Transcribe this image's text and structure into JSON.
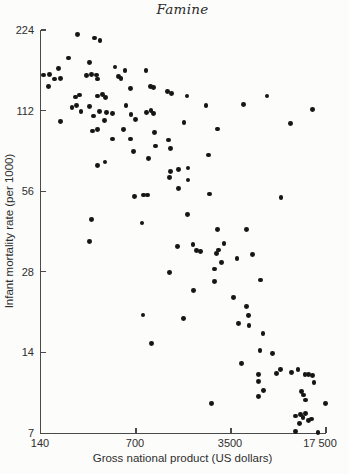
{
  "chart_data": {
    "type": "scatter",
    "title": "Famine",
    "xlabel": "Gross national product (US dollars)",
    "ylabel": "Infant mortality rate (per 1000)",
    "x_scale": "log",
    "y_scale": "log",
    "x_range": [
      140,
      17500
    ],
    "y_range": [
      7,
      224
    ],
    "grid": false,
    "x_ticks": [
      {
        "value": 140,
        "label": "140"
      },
      {
        "value": 700,
        "label": "700"
      },
      {
        "value": 3500,
        "label": "3500"
      },
      {
        "value": 17500,
        "label": "17 500"
      }
    ],
    "y_ticks": [
      {
        "value": 224,
        "label": "224"
      },
      {
        "value": 112,
        "label": "112"
      },
      {
        "value": 56,
        "label": "56"
      },
      {
        "value": 28,
        "label": "28"
      },
      {
        "value": 14,
        "label": "14"
      },
      {
        "value": 7,
        "label": "7"
      }
    ],
    "points": [
      [
        261,
        216
      ],
      [
        345,
        209
      ],
      [
        380,
        204
      ],
      [
        222,
        176
      ],
      [
        317,
        169
      ],
      [
        490,
        163
      ],
      [
        581,
        158
      ],
      [
        828,
        158
      ],
      [
        188,
        161
      ],
      [
        147,
        152
      ],
      [
        161,
        153
      ],
      [
        177,
        147
      ],
      [
        196,
        148
      ],
      [
        159,
        138
      ],
      [
        304,
        151
      ],
      [
        328,
        153
      ],
      [
        360,
        152
      ],
      [
        367,
        147
      ],
      [
        520,
        150
      ],
      [
        542,
        148
      ],
      [
        636,
        135
      ],
      [
        896,
        138
      ],
      [
        940,
        137
      ],
      [
        1200,
        132
      ],
      [
        1270,
        130
      ],
      [
        1660,
        127
      ],
      [
        250,
        126
      ],
      [
        270,
        128
      ],
      [
        367,
        127
      ],
      [
        398,
        129
      ],
      [
        416,
        125
      ],
      [
        196,
        102
      ],
      [
        237,
        115
      ],
      [
        256,
        117
      ],
      [
        276,
        111
      ],
      [
        317,
        116
      ],
      [
        340,
        107
      ],
      [
        376,
        111
      ],
      [
        409,
        103
      ],
      [
        426,
        110
      ],
      [
        471,
        109
      ],
      [
        590,
        117
      ],
      [
        643,
        108
      ],
      [
        692,
        104
      ],
      [
        840,
        110
      ],
      [
        902,
        112
      ],
      [
        938,
        109
      ],
      [
        336,
        94
      ],
      [
        366,
        95.5
      ],
      [
        564,
        95
      ],
      [
        953,
        92.5
      ],
      [
        1580,
        101
      ],
      [
        1220,
        87
      ],
      [
        2290,
        117
      ],
      [
        4310,
        118
      ],
      [
        6440,
        127
      ],
      [
        14000,
        113
      ],
      [
        9620,
        100
      ],
      [
        2790,
        95.6
      ],
      [
        471,
        87.7
      ],
      [
        635,
        87.7
      ],
      [
        971,
        82.6
      ],
      [
        1260,
        80.7
      ],
      [
        668,
        78.9
      ],
      [
        861,
        74
      ],
      [
        363,
        69.7
      ],
      [
        414,
        72
      ],
      [
        1260,
        66.4
      ],
      [
        1440,
        67.6
      ],
      [
        1690,
        68.4
      ],
      [
        1240,
        62.9
      ],
      [
        1690,
        61.7
      ],
      [
        1430,
        57.4
      ],
      [
        679,
        53.4
      ],
      [
        790,
        54.2
      ],
      [
        849,
        54.2
      ],
      [
        1670,
        45.9
      ],
      [
        330,
        43.8
      ],
      [
        775,
        42.6
      ],
      [
        317,
        36.3
      ],
      [
        2380,
        76.4
      ],
      [
        2420,
        54.7
      ],
      [
        8170,
        52.9
      ],
      [
        2790,
        40.3
      ],
      [
        4560,
        40.3
      ],
      [
        1420,
        34.7
      ],
      [
        1840,
        35.4
      ],
      [
        1950,
        33.7
      ],
      [
        2100,
        33.3
      ],
      [
        2850,
        33.8
      ],
      [
        2720,
        32.8
      ],
      [
        2990,
        30.3
      ],
      [
        2650,
        28.7
      ],
      [
        3110,
        35.6
      ],
      [
        3870,
        31.4
      ],
      [
        5030,
        32.4
      ],
      [
        2650,
        25.7
      ],
      [
        5800,
        26.1
      ],
      [
        1240,
        27.9
      ],
      [
        1850,
        23.8
      ],
      [
        3670,
        22.5
      ],
      [
        4580,
        20.8
      ],
      [
        787,
        19.3
      ],
      [
        1570,
        18.7
      ],
      [
        912,
        15.1
      ],
      [
        4720,
        19.2
      ],
      [
        3960,
        17.9
      ],
      [
        4740,
        17.7
      ],
      [
        6010,
        16.5
      ],
      [
        5720,
        14.2
      ],
      [
        7100,
        13.9
      ],
      [
        4190,
        12.7
      ],
      [
        5600,
        11.6
      ],
      [
        7540,
        11.7
      ],
      [
        8060,
        12.1
      ],
      [
        9710,
        11.8
      ],
      [
        10900,
        12.1
      ],
      [
        12250,
        11.6
      ],
      [
        13000,
        11.6
      ],
      [
        14000,
        11.5
      ],
      [
        5600,
        10.9
      ],
      [
        14300,
        10.8
      ],
      [
        6080,
        10.1
      ],
      [
        5600,
        9.6
      ],
      [
        11500,
        10
      ],
      [
        11950,
        9.7
      ],
      [
        12300,
        9.3
      ],
      [
        17400,
        9
      ],
      [
        2500,
        9
      ],
      [
        10400,
        8.1
      ],
      [
        11300,
        8.2
      ],
      [
        11850,
        8
      ],
      [
        12330,
        8.3
      ],
      [
        13040,
        7.8
      ],
      [
        13700,
        7.9
      ],
      [
        11100,
        7.6
      ],
      [
        10500,
        7.1
      ],
      [
        15300,
        7.05
      ]
    ]
  },
  "colors": {
    "dot": "#161616",
    "axis": "#4a4a4a",
    "text": "#2e2e2e",
    "background": "#fcfcfb"
  }
}
